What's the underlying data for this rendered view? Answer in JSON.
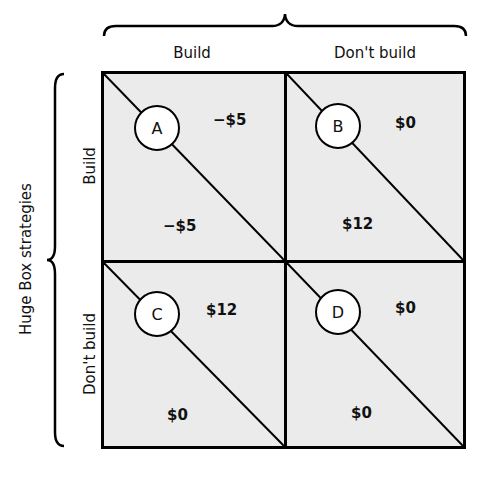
{
  "diagram": {
    "column_player_title": "",
    "row_player_title": "Huge Box strategies",
    "columns": [
      {
        "label": "Build"
      },
      {
        "label": "Don't build"
      }
    ],
    "rows": [
      {
        "label": "Build"
      },
      {
        "label": "Don't build"
      }
    ],
    "cells": [
      {
        "id": "A",
        "row": 0,
        "col": 0,
        "upper_right_payoff": "−$5",
        "lower_left_payoff": "−$5"
      },
      {
        "id": "B",
        "row": 0,
        "col": 1,
        "upper_right_payoff": "$0",
        "lower_left_payoff": "$12"
      },
      {
        "id": "C",
        "row": 1,
        "col": 0,
        "upper_right_payoff": "$12",
        "lower_left_payoff": "$0"
      },
      {
        "id": "D",
        "row": 1,
        "col": 1,
        "upper_right_payoff": "$0",
        "lower_left_payoff": "$0"
      }
    ],
    "colors": {
      "cell_background": "#ebebeb",
      "lines": "#000000",
      "circle_fill": "#ffffff"
    }
  }
}
